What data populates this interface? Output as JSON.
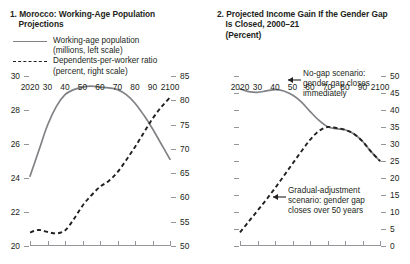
{
  "figure": {
    "panels": [
      {
        "number": "1.",
        "title_line1": "Morocco: Working-Age Population",
        "title_line2": "Projections",
        "units": "",
        "legend": [
          {
            "key": "solid-line-key",
            "label": "Working-age population",
            "sub": "(millions, left scale)"
          },
          {
            "key": "dashed-line-key",
            "label": "Dependents-per-worker ratio",
            "sub": "(percent, right scale)"
          }
        ]
      },
      {
        "number": "2.",
        "title_line1": "Projected Income Gain If the Gender Gap",
        "title_line2": "Is Closed, 2000–21",
        "units": "(Percent)",
        "annotations": [
          {
            "name": "no-gap-annotation",
            "line1": "No-gap scenario:",
            "line2": "gender gap closes",
            "line3": "immediately"
          },
          {
            "name": "gradual-adjustment-annotation",
            "line1": "Gradual-adjustment",
            "line2": "scenario: gender gap",
            "line3": "closes over 50 years"
          }
        ]
      }
    ]
  },
  "chart_data": [
    {
      "type": "line",
      "title": "1. Morocco: Working-Age Population Projections",
      "xlabel": "",
      "ylabel": "",
      "xlim": [
        2020,
        2100
      ],
      "xticks": [
        2020,
        2030,
        2040,
        2050,
        2060,
        2070,
        2080,
        2090,
        2100
      ],
      "xticklabels": [
        "2020",
        "30",
        "40",
        "50",
        "60",
        "70",
        "80",
        "90",
        "2100"
      ],
      "ylim": [
        20,
        30
      ],
      "yticks": [
        20,
        22,
        24,
        26,
        28,
        30
      ],
      "yticklabels": [
        "20",
        "22",
        "24",
        "26",
        "28",
        "30"
      ],
      "y2lim": [
        50,
        85
      ],
      "y2ticks": [
        50,
        55,
        60,
        65,
        70,
        75,
        80,
        85
      ],
      "y2ticklabels": [
        "50",
        "55",
        "60",
        "65",
        "70",
        "75",
        "80",
        "85"
      ],
      "grid": false,
      "legend_position": "top-center",
      "series": [
        {
          "name": "Working-age population (millions, left scale)",
          "axis": "left",
          "units": "millions",
          "style": "solid",
          "color": "#808285",
          "x": [
            2020,
            2025,
            2030,
            2035,
            2040,
            2045,
            2050,
            2055,
            2060,
            2065,
            2070,
            2075,
            2080,
            2085,
            2090,
            2095,
            2100
          ],
          "values": [
            24.1,
            25.6,
            27.1,
            28.2,
            28.9,
            29.2,
            29.35,
            29.4,
            29.35,
            29.3,
            29.2,
            28.9,
            28.4,
            27.7,
            26.9,
            26.0,
            25.1
          ]
        },
        {
          "name": "Dependents-per-worker ratio (percent, right scale)",
          "axis": "right",
          "units": "percent",
          "style": "dashed",
          "color": "#231f20",
          "x": [
            2020,
            2025,
            2030,
            2035,
            2040,
            2045,
            2050,
            2055,
            2060,
            2065,
            2070,
            2075,
            2080,
            2085,
            2090,
            2095,
            2100
          ],
          "values": [
            52.8,
            53.3,
            52.9,
            52.6,
            53.2,
            55.5,
            58.3,
            60.4,
            62.2,
            63.4,
            65.2,
            67.7,
            70.4,
            73.3,
            76.2,
            78.6,
            80.6
          ]
        }
      ]
    },
    {
      "type": "line",
      "title": "2. Projected Income Gain If the Gender Gap Is Closed, 2000–21",
      "xlabel": "",
      "ylabel": "Percent",
      "xlim": [
        2020,
        2100
      ],
      "xticks": [
        2020,
        2030,
        2040,
        2050,
        2060,
        2070,
        2080,
        2090,
        2100
      ],
      "xticklabels": [
        "2020",
        "30",
        "40",
        "50",
        "60",
        "70",
        "80",
        "90",
        "2100"
      ],
      "ylim": [
        0,
        50
      ],
      "yticks": [
        0,
        5,
        10,
        15,
        20,
        25,
        30,
        35,
        40,
        45,
        50
      ],
      "yticklabels": [
        "0",
        "5",
        "10",
        "15",
        "20",
        "25",
        "30",
        "35",
        "40",
        "45",
        "50"
      ],
      "grid": false,
      "legend_position": "none",
      "series": [
        {
          "name": "No-gap scenario: gender gap closes immediately",
          "style": "solid",
          "color": "#808285",
          "units": "percent",
          "x": [
            2020,
            2025,
            2030,
            2035,
            2040,
            2045,
            2050,
            2055,
            2060,
            2065,
            2070,
            2075,
            2080,
            2085,
            2090,
            2095,
            2100
          ],
          "values": [
            46.2,
            45.4,
            45.2,
            45.6,
            46.0,
            45.6,
            44.4,
            42.4,
            39.6,
            37.0,
            35.1,
            34.5,
            34.2,
            33.0,
            30.8,
            27.7,
            25.0
          ]
        },
        {
          "name": "Gradual-adjustment scenario: gender gap closes over 50 years",
          "style": "dashed",
          "color": "#231f20",
          "units": "percent",
          "x": [
            2020,
            2025,
            2030,
            2035,
            2040,
            2045,
            2050,
            2055,
            2060,
            2065,
            2070,
            2075,
            2080,
            2085,
            2090,
            2095,
            2100
          ],
          "values": [
            4.0,
            7.2,
            10.4,
            13.6,
            17.0,
            20.6,
            24.2,
            27.8,
            31.2,
            33.8,
            35.0,
            34.7,
            34.2,
            33.0,
            30.8,
            27.7,
            25.0
          ]
        }
      ]
    }
  ]
}
